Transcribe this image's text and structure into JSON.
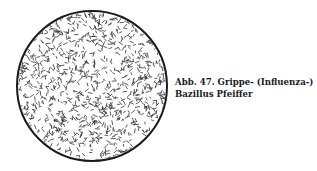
{
  "figure": {
    "caption_line1": "Abb. 47. Grippe- (Influenza-)",
    "caption_line2": "Bazillus Pfeiffer",
    "illustration": "microscope-field-bacilli",
    "colors": {
      "ink": "#1a1a1a",
      "background": "#ffffff"
    }
  }
}
